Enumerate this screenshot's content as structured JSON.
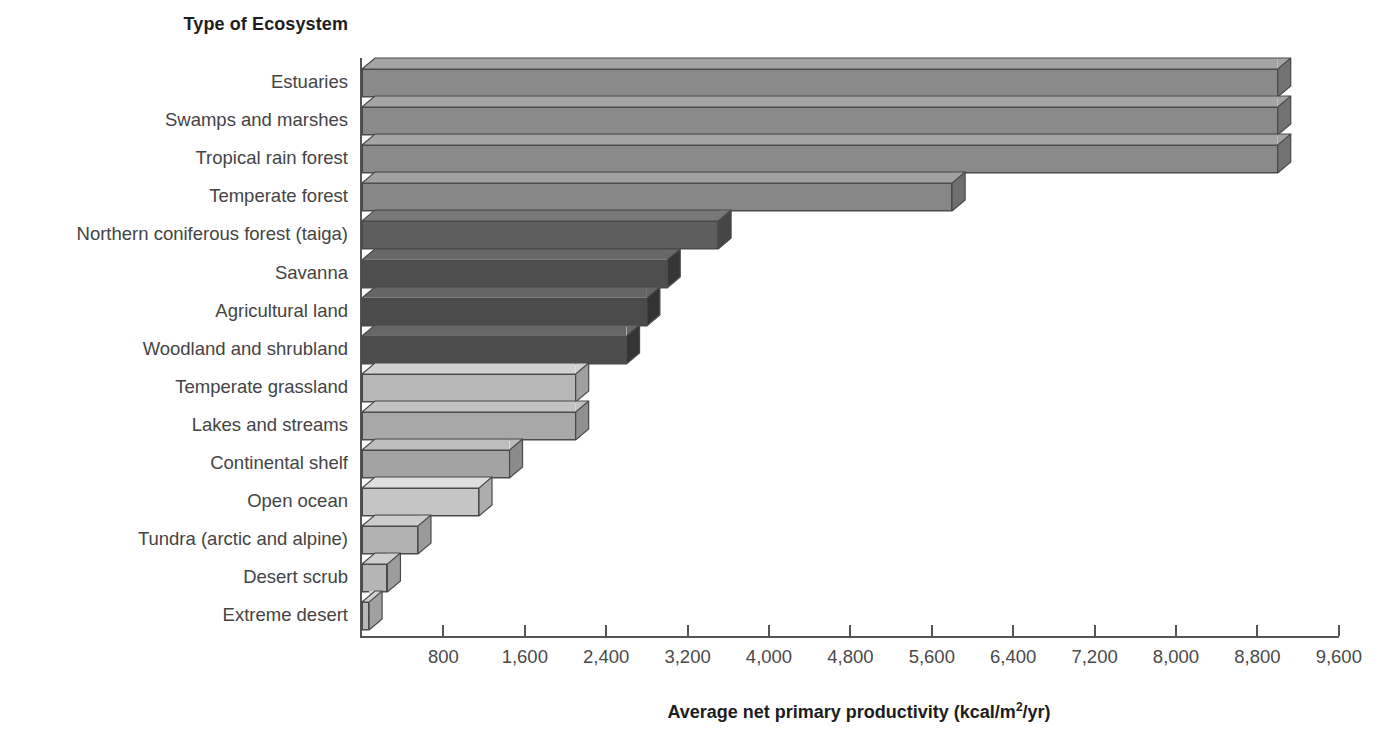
{
  "chart": {
    "category_axis_title": "Type of Ecosystem",
    "value_axis_title_prefix": "Average net primary productivity (kcal/m",
    "value_axis_title_sup": "2",
    "value_axis_title_suffix": "/yr)",
    "value_axis_title_full": "Average net primary productivity (kcal/m2/yr)"
  },
  "chart_data": {
    "type": "bar",
    "orientation": "horizontal",
    "title": "Type of Ecosystem",
    "xlabel": "Average net primary productivity (kcal/m2/yr)",
    "ylabel": "Type of Ecosystem",
    "xlim": [
      0,
      9600
    ],
    "grid": false,
    "legend": null,
    "tick_labels": [
      "800",
      "1,600",
      "2,400",
      "3,200",
      "4,000",
      "4,800",
      "5,600",
      "6,400",
      "7,200",
      "8,000",
      "8,800",
      "9,600"
    ],
    "tick_values": [
      800,
      1600,
      2400,
      3200,
      4000,
      4800,
      5600,
      6400,
      7200,
      8000,
      8800,
      9600
    ],
    "categories": [
      "Estuaries",
      "Swamps and marshes",
      "Tropical rain forest",
      "Temperate forest",
      "Northern coniferous forest (taiga)",
      "Savanna",
      "Agricultural land",
      "Woodland and shrubland",
      "Temperate grassland",
      "Lakes and streams",
      "Continental shelf",
      "Open ocean",
      "Tundra (arctic and alpine)",
      "Desert scrub",
      "Extreme desert"
    ],
    "values": [
      9000,
      9000,
      9000,
      5800,
      3500,
      3000,
      2800,
      2600,
      2100,
      2100,
      1450,
      1150,
      550,
      250,
      70
    ],
    "bar_colors": [
      "#8a8a8a",
      "#8a8a8a",
      "#8a8a8a",
      "#878787",
      "#5e5e5e",
      "#4e4e4e",
      "#4b4b4b",
      "#4d4d4d",
      "#b7b7b7",
      "#a8a8a8",
      "#a3a3a3",
      "#c5c5c5",
      "#b2b2b2",
      "#b5b5b5",
      "#b9b9b9"
    ]
  }
}
